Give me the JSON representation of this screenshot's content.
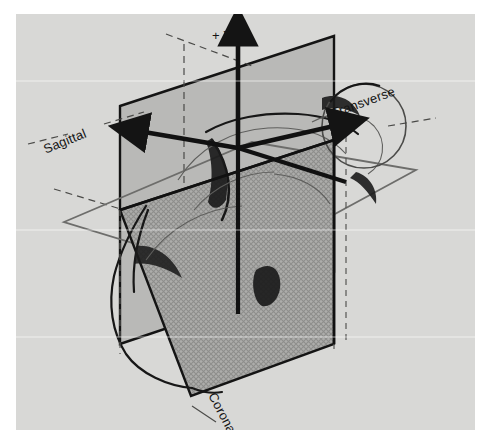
{
  "figure": {
    "background_color": "#d8d8d6",
    "ink_color": "#141414"
  },
  "axes": [
    {
      "id": "x",
      "label": "+ X",
      "direction": "up-left",
      "label_x": 120,
      "label_y": 110
    },
    {
      "id": "y",
      "label": "+ Y",
      "direction": "up",
      "label_x": 212,
      "label_y": 22
    },
    {
      "id": "z",
      "label": "+ Z",
      "direction": "right-toward-head",
      "label_x": 328,
      "label_y": 110
    }
  ],
  "planes": [
    {
      "id": "sagittal",
      "label": "Sagittal",
      "orientation": "vertical, left-facing",
      "fill_color": "#b9b9b7",
      "label_x": 28,
      "label_y": 128,
      "label_rotation": -22
    },
    {
      "id": "transverse",
      "label": "Transverse",
      "orientation": "horizontal",
      "fill_color": "none",
      "label_x": 330,
      "label_y": 95,
      "label_rotation": -20
    },
    {
      "id": "coronal",
      "label": "Coronal",
      "orientation": "vertical, front-facing, cross-hatched",
      "fill_color": "#a8a8a6",
      "label_x": 196,
      "label_y": 382,
      "label_rotation": 62
    }
  ]
}
